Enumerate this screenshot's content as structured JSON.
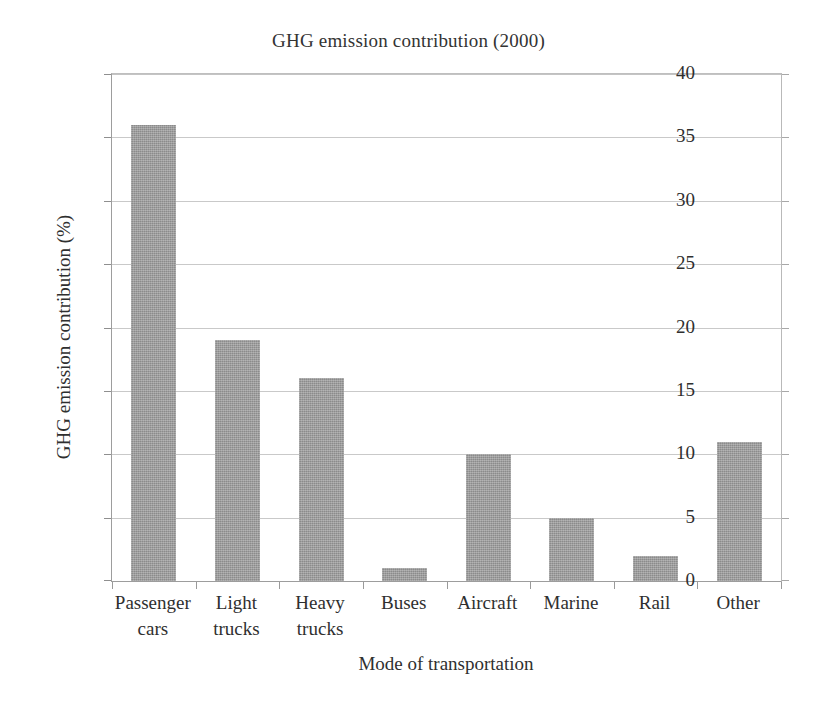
{
  "chart_data": {
    "type": "bar",
    "title": "GHG emission contribution (2000)",
    "xlabel": "Mode of transportation",
    "ylabel": "GHG emission contribution (%)",
    "categories": [
      "Passenger cars",
      "Light trucks",
      "Heavy trucks",
      "Buses",
      "Aircraft",
      "Marine",
      "Rail",
      "Other"
    ],
    "category_lines": [
      [
        "Passenger",
        "cars"
      ],
      [
        "Light",
        "trucks"
      ],
      [
        "Heavy",
        "trucks"
      ],
      [
        "Buses"
      ],
      [
        "Aircraft"
      ],
      [
        "Marine"
      ],
      [
        "Rail"
      ],
      [
        "Other"
      ]
    ],
    "values": [
      36,
      19,
      16,
      1,
      10,
      5,
      2,
      11
    ],
    "ylim": [
      0,
      40
    ],
    "ytick_step": 5,
    "ytick_labels": [
      "40",
      "35",
      "30",
      "25",
      "20",
      "15",
      "10",
      "5",
      "0"
    ],
    "ytick_values": [
      40,
      35,
      30,
      25,
      20,
      15,
      10,
      5,
      0
    ],
    "grid": true,
    "legend": false,
    "bar_color": "#9b9b9b",
    "grid_color": "#c9c9c9",
    "axis_color": "#9a9a9a",
    "text_color": "#2f2f2f",
    "background": "#ffffff"
  }
}
